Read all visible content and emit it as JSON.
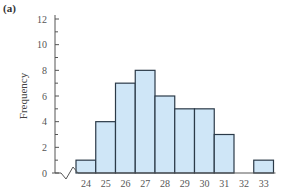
{
  "panel_label": "(a)",
  "chart_data": {
    "type": "bar",
    "title": "",
    "xlabel": "",
    "ylabel": "Frequency",
    "categories": [
      "24",
      "25",
      "26",
      "27",
      "28",
      "29",
      "30",
      "31",
      "32",
      "33"
    ],
    "values": [
      1,
      4,
      7,
      8,
      6,
      5,
      5,
      3,
      0,
      1
    ],
    "ylim": [
      0,
      12
    ],
    "yticks": [
      0,
      2,
      4,
      6,
      8,
      10,
      12
    ],
    "minor_yticks": [
      1,
      3,
      5,
      7,
      9,
      11
    ],
    "x_axis_break": true,
    "grid": false,
    "legend": null,
    "bar_color": "#cfe6f7",
    "bar_edge_color": "#2b3a48"
  }
}
